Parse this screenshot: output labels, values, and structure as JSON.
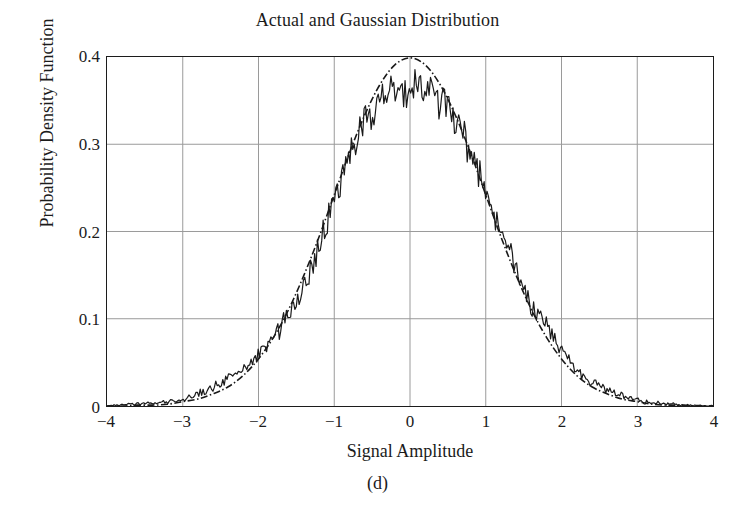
{
  "figure": {
    "caption": "(d)"
  },
  "chart_data": {
    "type": "line",
    "title": "Actual and Gaussian Distribution",
    "xlabel": "Signal Amplitude",
    "ylabel": "Probability Density Function",
    "xlim": [
      -4,
      4
    ],
    "ylim": [
      0,
      0.4
    ],
    "xticks": [
      -4,
      -3,
      -2,
      -1,
      0,
      1,
      2,
      3,
      4
    ],
    "xticklabels": [
      "−4",
      "−3",
      "−2",
      "−1",
      "0",
      "1",
      "2",
      "3",
      "4"
    ],
    "yticks": [
      0,
      0.1,
      0.2,
      0.3,
      0.4
    ],
    "yticklabels": [
      "0",
      "0.1",
      "0.2",
      "0.3",
      "0.4"
    ],
    "grid": true,
    "grid_color": "#9a9a9a",
    "legend": null,
    "series": [
      {
        "name": "Actual",
        "style": "solid",
        "color": "#1a1a1a",
        "description": "Noisy empirical probability density estimate of the signal amplitude",
        "x": [
          -4.0,
          -3.9,
          -3.8,
          -3.7,
          -3.6,
          -3.5,
          -3.4,
          -3.3,
          -3.2,
          -3.1,
          -3.0,
          -2.9,
          -2.8,
          -2.7,
          -2.6,
          -2.5,
          -2.4,
          -2.3,
          -2.2,
          -2.1,
          -2.0,
          -1.9,
          -1.8,
          -1.7,
          -1.6,
          -1.5,
          -1.4,
          -1.3,
          -1.2,
          -1.1,
          -1.0,
          -0.9,
          -0.8,
          -0.7,
          -0.6,
          -0.5,
          -0.4,
          -0.3,
          -0.2,
          -0.1,
          0.0,
          0.1,
          0.2,
          0.3,
          0.4,
          0.5,
          0.6,
          0.7,
          0.8,
          0.9,
          1.0,
          1.1,
          1.2,
          1.3,
          1.4,
          1.5,
          1.6,
          1.7,
          1.8,
          1.9,
          2.0,
          2.1,
          2.2,
          2.3,
          2.4,
          2.5,
          2.6,
          2.7,
          2.8,
          2.9,
          3.0,
          3.1,
          3.2,
          3.3,
          3.4,
          3.5,
          3.6,
          3.7,
          3.8,
          3.9,
          4.0
        ],
        "y": [
          0.0,
          0.001,
          0.001,
          0.002,
          0.002,
          0.003,
          0.003,
          0.004,
          0.005,
          0.006,
          0.008,
          0.011,
          0.014,
          0.018,
          0.022,
          0.026,
          0.031,
          0.036,
          0.042,
          0.05,
          0.058,
          0.069,
          0.08,
          0.091,
          0.106,
          0.124,
          0.14,
          0.158,
          0.183,
          0.208,
          0.235,
          0.262,
          0.287,
          0.31,
          0.326,
          0.338,
          0.348,
          0.355,
          0.36,
          0.364,
          0.366,
          0.368,
          0.36,
          0.352,
          0.346,
          0.336,
          0.324,
          0.308,
          0.289,
          0.268,
          0.245,
          0.222,
          0.201,
          0.178,
          0.158,
          0.137,
          0.118,
          0.102,
          0.097,
          0.076,
          0.063,
          0.052,
          0.043,
          0.034,
          0.028,
          0.023,
          0.019,
          0.015,
          0.012,
          0.009,
          0.007,
          0.005,
          0.004,
          0.003,
          0.002,
          0.002,
          0.001,
          0.001,
          0.001,
          0.0,
          0.0
        ]
      },
      {
        "name": "Gaussian",
        "style": "dash-dot",
        "color": "#1a1a1a",
        "description": "Theoretical Gaussian (normal) probability density function, mean 0, standard deviation 1",
        "mean": 0,
        "std": 1,
        "peak": 0.3989,
        "x": [
          -4.0,
          -3.8,
          -3.6,
          -3.4,
          -3.2,
          -3.0,
          -2.8,
          -2.6,
          -2.4,
          -2.2,
          -2.0,
          -1.8,
          -1.6,
          -1.4,
          -1.2,
          -1.0,
          -0.8,
          -0.6,
          -0.4,
          -0.2,
          0.0,
          0.2,
          0.4,
          0.6,
          0.8,
          1.0,
          1.2,
          1.4,
          1.6,
          1.8,
          2.0,
          2.2,
          2.4,
          2.6,
          2.8,
          3.0,
          3.2,
          3.4,
          3.6,
          3.8,
          4.0
        ],
        "y": [
          0.0,
          0.0,
          0.001,
          0.001,
          0.002,
          0.005,
          0.008,
          0.014,
          0.022,
          0.035,
          0.054,
          0.079,
          0.111,
          0.15,
          0.194,
          0.242,
          0.29,
          0.333,
          0.368,
          0.391,
          0.399,
          0.391,
          0.368,
          0.333,
          0.29,
          0.242,
          0.194,
          0.15,
          0.111,
          0.079,
          0.054,
          0.035,
          0.022,
          0.014,
          0.008,
          0.005,
          0.002,
          0.001,
          0.001,
          0.0,
          0.0
        ]
      }
    ]
  }
}
